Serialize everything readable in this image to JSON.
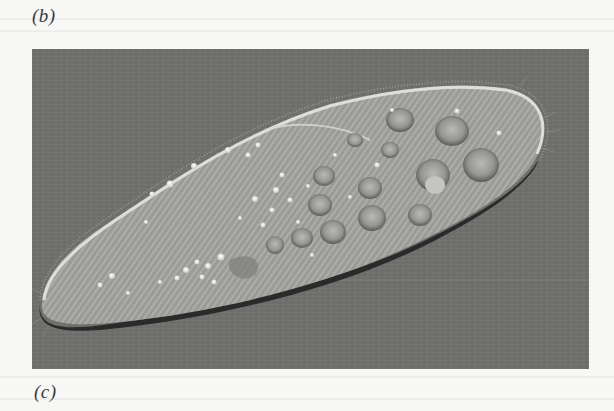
{
  "page": {
    "background": "#f7f7f6"
  },
  "labels": {
    "top_panel": "(b)",
    "bottom_panel": "(c)"
  },
  "figure": {
    "colors": {
      "background": "#6f6f6d",
      "cell_body": "#a3a3a0",
      "cell_edge_light": "#e4e4e0",
      "cell_edge_dark": "#1e1e1e",
      "vacuole": "#8c8c89",
      "granule": "#ecece8"
    }
  }
}
